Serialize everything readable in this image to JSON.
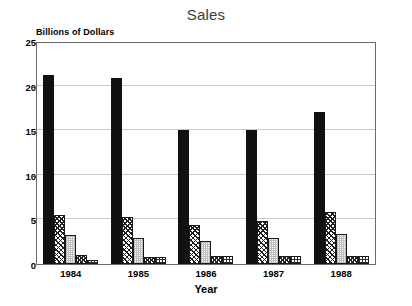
{
  "chart_data": {
    "type": "bar",
    "title": "Sales",
    "xlabel": "Year",
    "ylabel": "Billions of Dollars",
    "categories": [
      "1984",
      "1985",
      "1986",
      "1987",
      "1988"
    ],
    "ylim": [
      0,
      25
    ],
    "yticks": [
      0,
      5,
      10,
      15,
      20,
      25
    ],
    "ytick_labels": [
      "0",
      "5",
      "10",
      "15",
      "20",
      "25"
    ],
    "grid": true,
    "legend": false,
    "series": [
      {
        "name": "series-1",
        "pattern": "solid-black",
        "values": [
          21.2,
          20.9,
          15.0,
          15.0,
          17.0
        ]
      },
      {
        "name": "series-2",
        "pattern": "diagonal-hatch",
        "values": [
          5.5,
          5.3,
          4.4,
          4.8,
          5.8
        ]
      },
      {
        "name": "series-3",
        "pattern": "light-stipple",
        "values": [
          3.2,
          2.9,
          2.6,
          2.9,
          3.4
        ]
      },
      {
        "name": "series-4",
        "pattern": "dark-checker",
        "values": [
          1.0,
          0.8,
          0.9,
          0.9,
          0.9
        ]
      },
      {
        "name": "series-5",
        "pattern": "grid-crosshatch",
        "values": [
          0.5,
          0.8,
          0.9,
          0.9,
          0.9
        ]
      }
    ]
  }
}
